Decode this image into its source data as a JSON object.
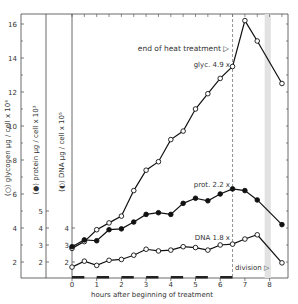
{
  "chart_data": {
    "type": "line",
    "title": "",
    "xlabel": "hours after beginning of treatment",
    "x_ticks": [
      0,
      1,
      2,
      3,
      4,
      5,
      6,
      7,
      8
    ],
    "xlim": [
      0,
      8.7
    ],
    "y_axes": [
      {
        "label": "(○) glycogen  µg / cell x 10⁴",
        "ticks": [
          2,
          4,
          6,
          8,
          10,
          12,
          14,
          16
        ],
        "minor_ticks": [
          3,
          5,
          7,
          9,
          11,
          13,
          15
        ],
        "ylim": [
          1,
          16.5
        ]
      },
      {
        "label": "(●) protein  µg / cell x 10³",
        "ticks": [
          2,
          3,
          4,
          5
        ],
        "ylim": [
          1,
          16.5
        ]
      },
      {
        "label": "(◐) DNA  µg / cell x 10⁵",
        "ticks": [
          2,
          3,
          4
        ],
        "ylim": [
          1,
          16.5
        ]
      }
    ],
    "series": [
      {
        "name": "glycogen",
        "marker": "open-circle",
        "x": [
          0,
          0.5,
          1,
          1.5,
          2,
          2.5,
          3,
          3.5,
          4,
          4.5,
          5,
          5.5,
          6,
          6.5,
          7,
          7.5,
          8.5
        ],
        "values": [
          2.8,
          3.2,
          3.9,
          4.3,
          4.7,
          6.2,
          7.4,
          7.9,
          9.2,
          9.7,
          11.0,
          11.9,
          12.8,
          13.5,
          16.2,
          15.0,
          12.5
        ]
      },
      {
        "name": "protein",
        "marker": "filled-circle",
        "x": [
          0,
          0.5,
          1,
          1.5,
          2,
          2.5,
          3,
          3.5,
          4,
          4.5,
          5,
          5.5,
          6,
          6.5,
          7,
          7.5,
          8.5
        ],
        "values": [
          2.9,
          3.3,
          3.25,
          3.9,
          3.95,
          4.35,
          4.8,
          4.9,
          4.8,
          5.45,
          5.75,
          5.6,
          6.0,
          6.3,
          6.2,
          5.65,
          4.2
        ]
      },
      {
        "name": "DNA",
        "marker": "open-circle",
        "x": [
          0,
          0.5,
          1,
          1.5,
          2,
          2.5,
          3,
          3.5,
          4,
          4.5,
          5,
          5.5,
          6,
          6.5,
          7,
          7.5,
          8.5
        ],
        "values": [
          1.7,
          2.05,
          1.8,
          2.1,
          2.15,
          2.4,
          2.75,
          2.65,
          2.7,
          2.9,
          2.85,
          2.7,
          3.0,
          3.05,
          3.35,
          3.6,
          1.95
        ]
      }
    ],
    "annotations": [
      {
        "text": "end of heat treatment ▷",
        "x": 6.5
      },
      {
        "text": "glyc. 4.9 x",
        "series": "glycogen",
        "x": 6.5
      },
      {
        "text": "prot. 2.2 x",
        "series": "protein",
        "x": 6.5
      },
      {
        "text": "DNA 1.8 x",
        "series": "DNA",
        "x": 6.5
      },
      {
        "text": "division ▷",
        "x_band": [
          7.8,
          8.05
        ]
      }
    ],
    "heat_pulses": [
      [
        0,
        0.5
      ],
      [
        1,
        1.5
      ],
      [
        2,
        2.5
      ],
      [
        3,
        3.5
      ],
      [
        4,
        4.5
      ],
      [
        5,
        5.5
      ],
      [
        6,
        6.5
      ]
    ],
    "vertical_dashed_line_x": 6.5,
    "shaded_band_x": [
      7.8,
      8.05
    ],
    "grid": false,
    "legend": "none (labels on axes)"
  },
  "labels": {
    "xlabel": "hours after beginning of treatment",
    "glycogen_axis": "(○) glycogen  µg / cell x 10⁴",
    "protein_axis": "(●) protein  µg / cell x 10³",
    "dna_axis": "(◐) DNA  µg / cell x 10⁵",
    "end_heat": "end of heat treatment ▷",
    "glyc_ann": "glyc. 4.9 x",
    "prot_ann": "prot. 2.2 x",
    "dna_ann": "DNA 1.8 x",
    "division": "division ▷"
  }
}
